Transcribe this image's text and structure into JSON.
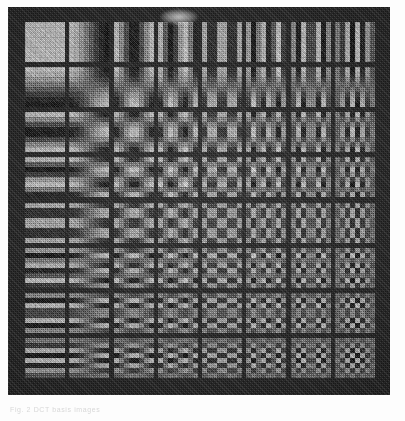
{
  "figure": {
    "caption": "Fig. 2 DCT basis images",
    "panel_background_hex": "#2b2b2b",
    "page_background_hex": "#fdfdfd",
    "artifact_label": "scan smudge"
  },
  "chart_data": {
    "type": "heatmap",
    "xlabel": "horizontal frequency u",
    "ylabel": "vertical frequency v",
    "grid": {
      "rows": 8,
      "cols": 8
    },
    "row_labels": [
      "0",
      "1",
      "2",
      "3",
      "4",
      "5",
      "6",
      "7"
    ],
    "col_labels": [
      "0",
      "1",
      "2",
      "3",
      "4",
      "5",
      "6",
      "7"
    ],
    "value_range": [
      -1,
      1
    ],
    "colormap": "grayscale",
    "basis_formula": "B(u,v)[x,y] = cos((2x+1)u*pi/16) * cos((2y+1)v*pi/16)",
    "cells": [
      {
        "v": 0,
        "u": 0,
        "desc": "uniform DC block"
      },
      {
        "v": 0,
        "u": 1,
        "desc": "one vertical half-cycle"
      },
      {
        "v": 0,
        "u": 2,
        "desc": "two vertical bands"
      },
      {
        "v": 0,
        "u": 3,
        "desc": "three vertical bands"
      },
      {
        "v": 0,
        "u": 4,
        "desc": "four vertical bands"
      },
      {
        "v": 0,
        "u": 5,
        "desc": "five vertical bands"
      },
      {
        "v": 0,
        "u": 6,
        "desc": "six vertical bands"
      },
      {
        "v": 0,
        "u": 7,
        "desc": "seven vertical bands"
      },
      {
        "v": 1,
        "u": 0,
        "desc": "one horizontal half-cycle"
      },
      {
        "v": 2,
        "u": 0,
        "desc": "two horizontal bands"
      },
      {
        "v": 3,
        "u": 0,
        "desc": "three horizontal bands"
      },
      {
        "v": 4,
        "u": 0,
        "desc": "four horizontal bands"
      },
      {
        "v": 5,
        "u": 0,
        "desc": "five horizontal bands"
      },
      {
        "v": 6,
        "u": 0,
        "desc": "six horizontal bands"
      },
      {
        "v": 7,
        "u": 0,
        "desc": "seven horizontal bands"
      },
      {
        "v": 7,
        "u": 7,
        "desc": "highest frequency checkerboard"
      }
    ],
    "render": {
      "cell_px": 40,
      "block_samples": 8,
      "gain": 1.0,
      "noise_amount": 38,
      "dither": true
    }
  }
}
